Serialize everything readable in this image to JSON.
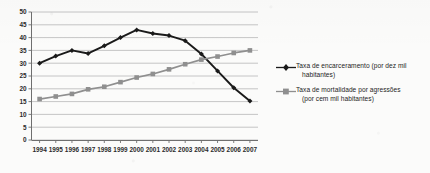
{
  "chart_data": {
    "type": "line",
    "title": "",
    "xlabel": "",
    "ylabel": "",
    "ylim": [
      0,
      50
    ],
    "ytick_step": 5,
    "yticks": [
      "0",
      "5",
      "10",
      "15",
      "20",
      "25",
      "30",
      "35",
      "40",
      "45",
      "50"
    ],
    "grid": true,
    "legend_position": "right",
    "categories": [
      "1994",
      "1995",
      "1996",
      "1997",
      "1998",
      "1999",
      "2000",
      "2001",
      "2002",
      "2003",
      "2004",
      "2005",
      "2006",
      "2007"
    ],
    "series": [
      {
        "name": "Taxa de encarceramento (por dez mil habitantes)",
        "name_line1": "Taxa de encarceramento (por dez mil",
        "name_line2": "habitantes)",
        "color": "#1a1a1a",
        "marker": "diamond",
        "values": [
          30.0,
          32.8,
          35.0,
          33.8,
          36.8,
          40.0,
          43.0,
          41.6,
          40.8,
          38.8,
          33.6,
          27.0,
          20.4,
          15.2
        ]
      },
      {
        "name": "Taxa de mortalidade por agressões (por cem mil habitantes)",
        "name_line1": "Taxa de mortalidade por agressões",
        "name_line2": "(por cem mil habitantes)",
        "color": "#8f8f8f",
        "marker": "square",
        "values": [
          16.0,
          17.0,
          18.0,
          19.8,
          20.8,
          22.6,
          24.4,
          25.8,
          27.6,
          29.6,
          31.4,
          32.6,
          34.0,
          35.0
        ]
      }
    ]
  },
  "legend": {
    "entries": [
      {
        "line1": "Taxa de encarceramento (por dez mil",
        "line2": "habitantes)"
      },
      {
        "line1": "Taxa de mortalidade por agressões",
        "line2": "(por cem mil habitantes)"
      }
    ]
  },
  "colors": {
    "series1": "#1a1a1a",
    "series2": "#8f8f8f",
    "grid": "#b8b8b8",
    "axis": "#6f6f6f",
    "background": "#fbfbfa"
  }
}
